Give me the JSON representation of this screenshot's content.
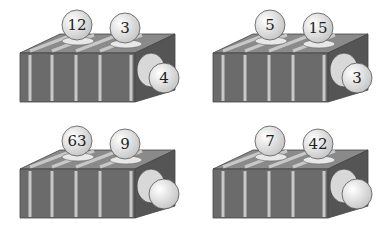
{
  "puzzle": {
    "description": "Number machines: two input balls on top, one output ball at side",
    "colors": {
      "box_front": "#6b6b6b",
      "box_top": "#8a8a8a",
      "box_side": "#555555",
      "stripe": "#c8c8c8",
      "ball": "#f2f2f2",
      "ball_outline": "#555555"
    },
    "machines": [
      {
        "input_a": "12",
        "input_b": "3",
        "output": "4"
      },
      {
        "input_a": "5",
        "input_b": "15",
        "output": "3"
      },
      {
        "input_a": "63",
        "input_b": "9",
        "output": ""
      },
      {
        "input_a": "7",
        "input_b": "42",
        "output": ""
      }
    ]
  }
}
